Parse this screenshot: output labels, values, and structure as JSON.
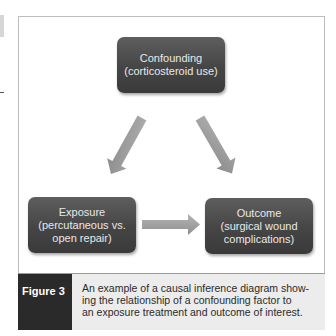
{
  "diagram": {
    "nodes": {
      "confounding": {
        "title": "Confounding",
        "subtitle_lines": [
          "(corticosteroid use)"
        ]
      },
      "exposure": {
        "title": "Exposure",
        "subtitle_lines": [
          "(percutaneous vs.",
          "open repair)"
        ]
      },
      "outcome": {
        "title": "Outcome",
        "subtitle_lines": [
          "(surgical wound",
          "complications)"
        ]
      }
    },
    "edges": [
      {
        "from": "confounding",
        "to": "exposure"
      },
      {
        "from": "confounding",
        "to": "outcome"
      },
      {
        "from": "exposure",
        "to": "outcome"
      }
    ],
    "colors": {
      "node_fill": "#474747",
      "node_text": "#e8e8e8",
      "arrow_fill": "#9a9a9a",
      "caption_label_bg": "#2a2a2a",
      "caption_text_bg": "#ececec"
    }
  },
  "caption": {
    "label": "Figure 3",
    "lines": [
      "An example of a causal inference diagram show-",
      "ing the relationship of a confounding factor to",
      "an exposure treatment and outcome of interest."
    ]
  }
}
